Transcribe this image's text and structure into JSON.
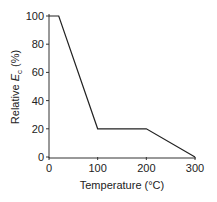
{
  "chart_data": {
    "type": "line",
    "title": "",
    "xlabel": "Temperature (°C)",
    "ylabel": "Relative E_c (%)",
    "ylabel_parts": {
      "pre": "Relative ",
      "sym": "E",
      "sub": "c",
      "post": " (%)"
    },
    "xlim": [
      0,
      300
    ],
    "ylim": [
      0,
      100
    ],
    "xticks": [
      0,
      100,
      200,
      300
    ],
    "yticks": [
      0,
      20,
      40,
      60,
      80,
      100
    ],
    "grid": false,
    "series": [
      {
        "name": "Relative Ec",
        "x": [
          0,
          20,
          100,
          200,
          300
        ],
        "y": [
          100,
          100,
          20,
          20,
          0
        ]
      }
    ]
  }
}
